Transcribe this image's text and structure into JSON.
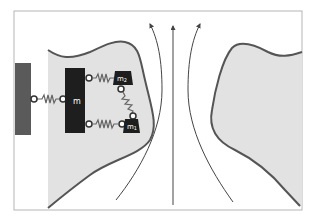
{
  "diagram": {
    "colors": {
      "frame": "#b5b5b5",
      "body_fill": "#e2e2e2",
      "body_outline": "#555555",
      "wall": "#5a5a5a",
      "mass": "#1e1e1e",
      "spring": "#666666",
      "streamline": "#444444",
      "label_on_dark": "#ffffff"
    },
    "labels": {
      "main_mass": "m",
      "mass_upper": "m",
      "mass_upper_sub": "2",
      "mass_lower": "m",
      "mass_lower_sub": "1"
    },
    "streamlines": [
      "left-curved",
      "center-straight",
      "right-curved"
    ]
  }
}
